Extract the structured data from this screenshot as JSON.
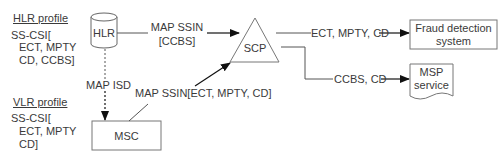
{
  "hlr_profile": {
    "title": "HLR profile",
    "lines": [
      "SS-CSI[",
      "ECT, MPTY",
      "CD, CCBS]"
    ]
  },
  "vlr_profile": {
    "title": "VLR profile",
    "lines": [
      "SS-CSI[",
      "ECT, MPTY",
      "CD]"
    ]
  },
  "nodes": {
    "hlr": "HLR",
    "scp": "SCP",
    "msc": "MSC",
    "fraud": [
      "Fraud detection",
      "system"
    ],
    "msp": [
      "MSP",
      "service"
    ]
  },
  "edges": {
    "hlr_to_scp": [
      "MAP SSIN",
      "[CCBS]"
    ],
    "hlr_to_msc": "MAP ISD",
    "msc_to_scp": "MAP SSIN[ECT, MPTY, CD]",
    "scp_to_fraud": "ECT, MPTY, CD",
    "scp_to_msp": "CCBS, CD"
  },
  "colors": {
    "stroke": "#555555",
    "text": "#3a3a3a",
    "arrow": "#111111"
  }
}
